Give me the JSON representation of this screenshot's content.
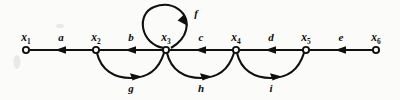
{
  "diagram": {
    "type": "directed-graph",
    "background_color": "#fbfbfa",
    "ink_color": "#101010",
    "baseline_y": 50,
    "nodes": [
      {
        "id": "x1",
        "label_base": "x",
        "label_sub": "1",
        "x": 26,
        "y": 50
      },
      {
        "id": "x2",
        "label_base": "x",
        "label_sub": "2",
        "x": 96,
        "y": 50
      },
      {
        "id": "x3",
        "label_base": "x",
        "label_sub": "3",
        "x": 166,
        "y": 50
      },
      {
        "id": "x4",
        "label_base": "x",
        "label_sub": "4",
        "x": 236,
        "y": 50
      },
      {
        "id": "x5",
        "label_base": "x",
        "label_sub": "5",
        "x": 306,
        "y": 50
      },
      {
        "id": "x6",
        "label_base": "x",
        "label_sub": "6",
        "x": 376,
        "y": 50
      }
    ],
    "edges": [
      {
        "id": "a",
        "label": "a",
        "from": "x1",
        "to": "x2",
        "shape": "straight",
        "label_x": 61,
        "label_y": 40
      },
      {
        "id": "b",
        "label": "b",
        "from": "x2",
        "to": "x3",
        "shape": "straight",
        "label_x": 131,
        "label_y": 40
      },
      {
        "id": "c",
        "label": "c",
        "from": "x3",
        "to": "x4",
        "shape": "straight",
        "label_x": 201,
        "label_y": 40
      },
      {
        "id": "d",
        "label": "d",
        "from": "x4",
        "to": "x5",
        "shape": "straight",
        "label_x": 271,
        "label_y": 40
      },
      {
        "id": "e",
        "label": "e",
        "from": "x5",
        "to": "x6",
        "shape": "straight",
        "label_x": 341,
        "label_y": 40
      },
      {
        "id": "f",
        "label": "f",
        "from": "x3",
        "to": "x3",
        "shape": "self-loop-above",
        "label_x": 194,
        "label_y": 15
      },
      {
        "id": "g",
        "label": "g",
        "from": "x2",
        "to": "x3",
        "shape": "arc-below",
        "label_x": 131,
        "label_y": 86
      },
      {
        "id": "h",
        "label": "h",
        "from": "x3",
        "to": "x4",
        "shape": "arc-below",
        "label_x": 201,
        "label_y": 86
      },
      {
        "id": "i",
        "label": "i",
        "from": "x4",
        "to": "x5",
        "shape": "arc-below",
        "label_x": 271,
        "label_y": 86
      }
    ]
  }
}
